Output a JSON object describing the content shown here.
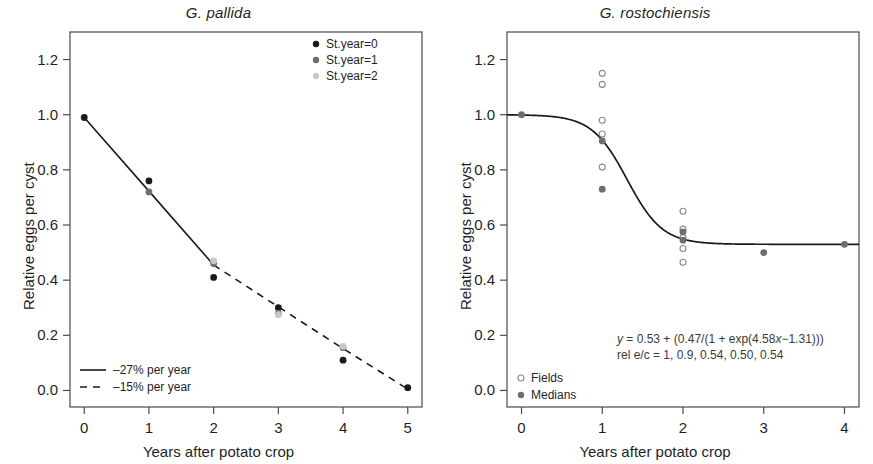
{
  "figure": {
    "width": 873,
    "height": 464,
    "background": "#ffffff"
  },
  "panels": [
    {
      "id": "g-pallida",
      "title": "G. pallida",
      "xlabel": "Years after potato crop",
      "ylabel": "Relative eggs per cyst"
    },
    {
      "id": "g-rostochiensis",
      "title": "G. rostochiensis",
      "xlabel": "Years after potato crop",
      "ylabel": "Relative eggs per cyst"
    }
  ],
  "legend_left_top": {
    "items": [
      {
        "label": "St.year=0",
        "marker": "filled-circle",
        "color": "#1a1a1a"
      },
      {
        "label": "St.year=1",
        "marker": "filled-circle",
        "color": "#6e6e6e"
      },
      {
        "label": "St.year=2",
        "marker": "filled-circle",
        "color": "#c8c8c8"
      }
    ]
  },
  "legend_left_bottom": {
    "items": [
      {
        "label": "–27% per year",
        "marker": "solid-line",
        "color": "#1a1a1a"
      },
      {
        "label": "–15% per year",
        "marker": "dashed-line",
        "color": "#1a1a1a"
      }
    ]
  },
  "legend_right": {
    "items": [
      {
        "label": "Fields",
        "marker": "open-circle",
        "color": "#8a8a8a"
      },
      {
        "label": "Medians",
        "marker": "filled-circle",
        "color": "#6e6e6e"
      }
    ]
  },
  "annotation_right": {
    "line1_prefix": "y",
    "line1_rest": " = 0.53 + (0.47/(1 + exp(4.58",
    "line1_var": "x",
    "line1_tail": "−1.31)))",
    "line2": "rel e/c = 1, 0.9, 0.54, 0.50, 0.54"
  },
  "chart_data": [
    {
      "type": "scatter",
      "id": "g-pallida",
      "title": "G. pallida",
      "xlabel": "Years after potato crop",
      "ylabel": "Relative eggs per cyst",
      "xlim": [
        -0.22,
        5.22
      ],
      "ylim": [
        -0.06,
        1.3
      ],
      "xticks": [
        0,
        1,
        2,
        3,
        4,
        5
      ],
      "xticklabels": [
        "0",
        "1",
        "2",
        "3",
        "4",
        "5"
      ],
      "yticks": [
        0.0,
        0.2,
        0.4,
        0.6,
        0.8,
        1.0,
        1.2
      ],
      "yticklabels": [
        "0.0",
        "0.2",
        "0.4",
        "0.6",
        "0.8",
        "1.0",
        "1.2"
      ],
      "grid": false,
      "legend_position": "upper right",
      "series": [
        {
          "name": "St.year=0",
          "marker": "filled-circle",
          "color": "#1a1a1a",
          "points": [
            {
              "x": 0,
              "y": 0.99
            },
            {
              "x": 1,
              "y": 0.76
            },
            {
              "x": 2,
              "y": 0.41
            },
            {
              "x": 3,
              "y": 0.3
            },
            {
              "x": 4,
              "y": 0.11
            },
            {
              "x": 5,
              "y": 0.01
            }
          ]
        },
        {
          "name": "St.year=1",
          "marker": "filled-circle",
          "color": "#6e6e6e",
          "points": [
            {
              "x": 1,
              "y": 0.72
            },
            {
              "x": 2,
              "y": 0.46
            },
            {
              "x": 3,
              "y": 0.28
            },
            {
              "x": 4,
              "y": 0.155
            }
          ]
        },
        {
          "name": "St.year=2",
          "marker": "filled-circle",
          "color": "#c8c8c8",
          "points": [
            {
              "x": 2,
              "y": 0.47
            },
            {
              "x": 3,
              "y": 0.275
            },
            {
              "x": 4,
              "y": 0.16
            }
          ]
        }
      ],
      "fit_lines": [
        {
          "name": "–27% per year",
          "style": "solid",
          "color": "#1a1a1a",
          "points": [
            {
              "x": 0,
              "y": 0.99
            },
            {
              "x": 1,
              "y": 0.723
            },
            {
              "x": 2,
              "y": 0.455
            }
          ]
        },
        {
          "name": "–15% per year",
          "style": "dashed",
          "color": "#1a1a1a",
          "points": [
            {
              "x": 2,
              "y": 0.455
            },
            {
              "x": 3,
              "y": 0.303
            },
            {
              "x": 4,
              "y": 0.152
            },
            {
              "x": 5,
              "y": 0.005
            }
          ]
        }
      ]
    },
    {
      "type": "scatter",
      "id": "g-rostochiensis",
      "title": "G. rostochiensis",
      "xlabel": "Years after potato crop",
      "ylabel": "Relative eggs per cyst",
      "xlim": [
        -0.18,
        4.18
      ],
      "ylim": [
        -0.06,
        1.3
      ],
      "xticks": [
        0,
        1,
        2,
        3,
        4
      ],
      "xticklabels": [
        "0",
        "1",
        "2",
        "3",
        "4"
      ],
      "yticks": [
        0.0,
        0.2,
        0.4,
        0.6,
        0.8,
        1.0,
        1.2
      ],
      "yticklabels": [
        "0.0",
        "0.2",
        "0.4",
        "0.6",
        "0.8",
        "1.0",
        "1.2"
      ],
      "grid": false,
      "legend_position": "lower left",
      "series": [
        {
          "name": "Fields",
          "marker": "open-circle",
          "color": "#8a8a8a",
          "points": [
            {
              "x": 1,
              "y": 1.15
            },
            {
              "x": 1,
              "y": 1.11
            },
            {
              "x": 1,
              "y": 0.98
            },
            {
              "x": 1,
              "y": 0.93
            },
            {
              "x": 1,
              "y": 0.81
            },
            {
              "x": 2,
              "y": 0.65
            },
            {
              "x": 2,
              "y": 0.585
            },
            {
              "x": 2,
              "y": 0.555
            },
            {
              "x": 2,
              "y": 0.515
            },
            {
              "x": 2,
              "y": 0.465
            }
          ]
        },
        {
          "name": "Medians",
          "marker": "filled-circle",
          "color": "#6e6e6e",
          "points": [
            {
              "x": 0,
              "y": 1.0
            },
            {
              "x": 1,
              "y": 0.905
            },
            {
              "x": 1,
              "y": 0.73
            },
            {
              "x": 2,
              "y": 0.575
            },
            {
              "x": 2,
              "y": 0.545
            },
            {
              "x": 3,
              "y": 0.5
            },
            {
              "x": 4,
              "y": 0.53
            }
          ]
        }
      ],
      "fit_curve": {
        "name": "logistic fit",
        "equation": "y = 0.53 + (0.47/(1 + exp(4.58x−1.31)))",
        "style": "solid",
        "color": "#1a1a1a",
        "asymptote_low": 0.53,
        "amplitude": 0.47,
        "rate": 4.58,
        "offset": 1.31
      },
      "annotations": [
        "y = 0.53 + (0.47/(1 + exp(4.58x−1.31)))",
        "rel e/c = 1, 0.9, 0.54, 0.50, 0.54"
      ]
    }
  ]
}
